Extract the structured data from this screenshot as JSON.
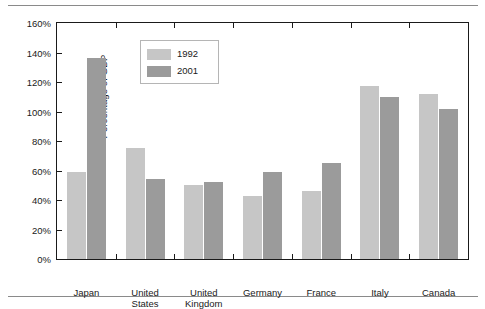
{
  "chart_data": {
    "type": "bar",
    "title": "",
    "xlabel": "",
    "ylabel": "Percentage of GDP",
    "ylim": [
      0,
      160
    ],
    "ytick_labels": [
      "0%",
      "20%",
      "40%",
      "60%",
      "80%",
      "100%",
      "120%",
      "140%",
      "160%"
    ],
    "ytick_values": [
      0,
      20,
      40,
      60,
      80,
      100,
      120,
      140,
      160
    ],
    "grid": false,
    "legend_position": "upper-left-inside",
    "categories": [
      "Japan",
      "United\nStates",
      "United\nKingdom",
      "Germany",
      "France",
      "Italy",
      "Canada"
    ],
    "series": [
      {
        "name": "1992",
        "color": "#c6c6c6",
        "values": [
          59,
          75,
          50,
          43,
          46,
          117,
          112
        ]
      },
      {
        "name": "2001",
        "color": "#9b9b9b",
        "values": [
          136,
          54,
          52,
          59,
          65,
          110,
          102
        ]
      }
    ]
  },
  "legend": {
    "entries": [
      {
        "label": "1992"
      },
      {
        "label": "2001"
      }
    ]
  },
  "colors": {
    "series_1992": "#c6c6c6",
    "series_2001": "#9b9b9b",
    "axis": "#1a1a1a",
    "rule": "#8a8a8a",
    "background": "#ffffff"
  }
}
